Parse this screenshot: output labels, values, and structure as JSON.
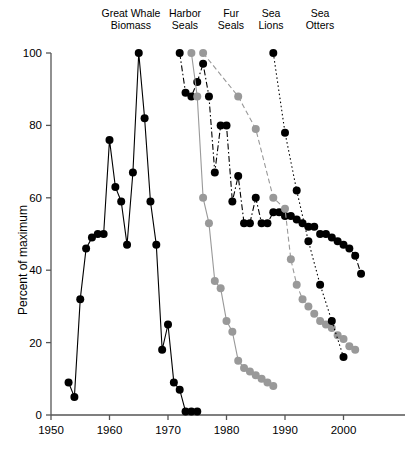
{
  "chart_data": {
    "type": "line",
    "title": "",
    "xlabel": "",
    "ylabel": "Percent of maximum",
    "xlim": [
      1950,
      2005
    ],
    "ylim": [
      0,
      100
    ],
    "xticks": [
      1950,
      1960,
      1970,
      1980,
      1990,
      2000
    ],
    "yticks": [
      0,
      20,
      40,
      60,
      80,
      100
    ],
    "grid": false,
    "legend_position": "top-inline-labels",
    "series": [
      {
        "name": "Great Whale Biomass",
        "color": "#000000",
        "marker": "filled-circle",
        "line_style": "solid",
        "x": [
          1953,
          1954,
          1955,
          1956,
          1957,
          1958,
          1959,
          1960,
          1961,
          1962,
          1963,
          1964,
          1965,
          1966,
          1967,
          1968,
          1969,
          1970,
          1971,
          1972,
          1973,
          1974,
          1975
        ],
        "y": [
          9,
          5,
          32,
          46,
          49,
          50,
          50,
          76,
          63,
          59,
          47,
          67,
          100,
          82,
          59,
          47,
          18,
          25,
          9,
          7,
          1,
          1,
          1
        ]
      },
      {
        "name": "Harbor Seals",
        "color": "#000000",
        "marker": "filled-circle",
        "line_style": "dash-dot",
        "x": [
          1972,
          1973,
          1974,
          1975,
          1976,
          1977,
          1978,
          1979,
          1980,
          1981,
          1982,
          1983,
          1984,
          1985,
          1986,
          1987,
          1988,
          1989,
          1990,
          1991,
          1992,
          1993,
          1994,
          1995,
          1996,
          1997,
          1998,
          1999,
          2000,
          2001,
          2002,
          2003
        ],
        "y": [
          100,
          89,
          88,
          92,
          97,
          88,
          67,
          80,
          80,
          59,
          66,
          53,
          53,
          60,
          53,
          53,
          56,
          56,
          55,
          55,
          54,
          53,
          52,
          52,
          50,
          50,
          49,
          48,
          47,
          46,
          44,
          39
        ]
      },
      {
        "name": "Fur Seals",
        "color": "#999999",
        "marker": "filled-circle",
        "line_style": "solid",
        "x": [
          1974,
          1975,
          1976,
          1977,
          1978,
          1979,
          1980,
          1981,
          1982,
          1983,
          1984,
          1985,
          1986,
          1987,
          1988
        ],
        "y": [
          100,
          88,
          60,
          53,
          37,
          35,
          26,
          23,
          15,
          13,
          12,
          11,
          10,
          9,
          8
        ]
      },
      {
        "name": "Sea Lions",
        "color": "#999999",
        "marker": "filled-circle",
        "line_style": "dashed",
        "x": [
          1976,
          1982,
          1985,
          1988,
          1990,
          1991,
          1992,
          1993,
          1994,
          1995,
          1996,
          1997,
          1998,
          1999,
          2000,
          2001,
          2002
        ],
        "y": [
          100,
          88,
          79,
          60,
          57,
          43,
          36,
          32,
          30,
          28,
          26,
          25,
          24,
          22,
          21,
          19,
          18
        ]
      },
      {
        "name": "Sea Otters",
        "color": "#000000",
        "marker": "filled-circle",
        "line_style": "dotted",
        "x": [
          1988,
          1990,
          1992,
          1994,
          1996,
          1998,
          2000
        ],
        "y": [
          100,
          78,
          62,
          48,
          36,
          26,
          16
        ]
      }
    ],
    "series_labels": [
      {
        "text": "Great Whale\nBiomass",
        "x": 1965
      },
      {
        "text": "Harbor\nSeals",
        "x": 1977
      },
      {
        "text": "Fur\nSeals",
        "x": 1983
      },
      {
        "text": "Sea\nLions",
        "x": 1988
      },
      {
        "text": "Sea\nOtters",
        "x": 1994
      }
    ]
  },
  "axes": {
    "y_title": "Percent of maximum",
    "y_tick_labels": [
      "0",
      "20",
      "40",
      "60",
      "80",
      "100"
    ],
    "x_tick_labels": [
      "1950",
      "1960",
      "1970",
      "1980",
      "1990",
      "2000"
    ]
  },
  "labels": {
    "great_whale": "Great Whale\nBiomass",
    "harbor_seals": "Harbor\nSeals",
    "fur_seals": "Fur\nSeals",
    "sea_lions": "Sea\nLions",
    "sea_otters": "Sea\nOtters"
  },
  "colors": {
    "black_series": "#000000",
    "gray_series": "#999999",
    "axis": "#555555"
  }
}
